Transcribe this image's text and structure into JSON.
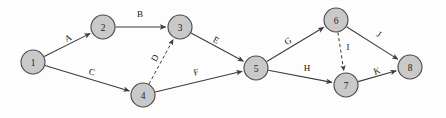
{
  "diagram": {
    "type": "activity-on-arrow network diagram",
    "node_shape": "circle",
    "node_fill": "#c9c9c9",
    "node_stroke": "#4a4a4a",
    "edge_color": "#3c3c3c",
    "background": "#fdfdfd",
    "nodes": [
      {
        "id": "1",
        "label": "1",
        "cx": 33,
        "cy": 62,
        "r": 12
      },
      {
        "id": "2",
        "label": "2",
        "cx": 103,
        "cy": 27,
        "r": 12
      },
      {
        "id": "3",
        "label": "3",
        "cx": 180,
        "cy": 27,
        "r": 12
      },
      {
        "id": "4",
        "label": "4",
        "cx": 143,
        "cy": 95,
        "r": 12
      },
      {
        "id": "5",
        "label": "5",
        "cx": 256,
        "cy": 68,
        "r": 12
      },
      {
        "id": "6",
        "label": "6",
        "cx": 336,
        "cy": 20,
        "r": 12
      },
      {
        "id": "7",
        "label": "7",
        "cx": 346,
        "cy": 85,
        "r": 12
      },
      {
        "id": "8",
        "label": "8",
        "cx": 410,
        "cy": 67,
        "r": 12
      }
    ],
    "edges": [
      {
        "id": "edge-A",
        "label": "A",
        "from": "1",
        "to": "2",
        "style": "solid",
        "arrow": true,
        "lx": 68,
        "ly": 38,
        "rot": -27
      },
      {
        "id": "edge-B",
        "label": "B",
        "from": "2",
        "to": "3",
        "style": "solid",
        "arrow": true,
        "lx": 140,
        "ly": 14,
        "rot": 0
      },
      {
        "id": "edge-C",
        "label": "C",
        "from": "1",
        "to": "4",
        "style": "solid",
        "arrow": true,
        "lx": 92,
        "ly": 72,
        "rot": 16
      },
      {
        "id": "edge-D",
        "label": "D",
        "from": "4",
        "to": "3",
        "style": "dashed",
        "arrow": true,
        "lx": 155,
        "ly": 58,
        "rot": -62
      },
      {
        "id": "edge-E",
        "label": "E",
        "from": "3",
        "to": "5",
        "style": "solid",
        "arrow": true,
        "lx": 216,
        "ly": 40,
        "rot": 27
      },
      {
        "id": "edge-F",
        "label": "F",
        "from": "4",
        "to": "5",
        "style": "solid",
        "arrow": true,
        "lx": 196,
        "ly": 72,
        "rot": -13
      },
      {
        "id": "edge-G",
        "label": "G",
        "from": "5",
        "to": "6",
        "style": "solid",
        "arrow": true,
        "lx": 288,
        "ly": 41,
        "rot": -29
      },
      {
        "id": "edge-H",
        "label": "H",
        "from": "5",
        "to": "7",
        "style": "solid",
        "arrow": true,
        "lx": 307,
        "ly": 68,
        "rot": 0
      },
      {
        "id": "edge-I",
        "label": "I",
        "from": "6",
        "to": "7",
        "style": "dashed",
        "arrow": true,
        "lx": 348,
        "ly": 47,
        "rot": 0
      },
      {
        "id": "edge-J",
        "label": "J",
        "from": "6",
        "to": "8",
        "style": "solid",
        "arrow": true,
        "lx": 379,
        "ly": 34,
        "rot": 36
      },
      {
        "id": "edge-K",
        "label": "K",
        "from": "7",
        "to": "8",
        "style": "solid",
        "arrow": true,
        "lx": 377,
        "ly": 71,
        "rot": -18
      }
    ]
  }
}
